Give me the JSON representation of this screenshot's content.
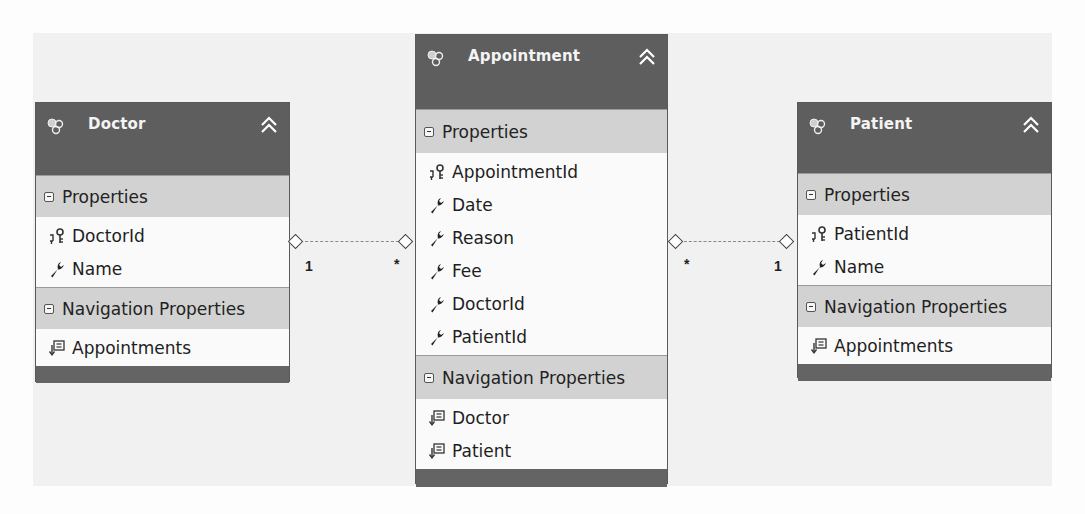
{
  "diagram": {
    "type": "entity-data-model",
    "entities": [
      {
        "name": "Doctor",
        "icon": "entity-icon",
        "collapse_icon": "double-chevron-up-icon",
        "sections": [
          {
            "title": "Properties",
            "items": [
              {
                "label": "DoctorId",
                "icon": "key-icon"
              },
              {
                "label": "Name",
                "icon": "wrench-icon"
              }
            ]
          },
          {
            "title": "Navigation Properties",
            "items": [
              {
                "label": "Appointments",
                "icon": "navigation-property-icon"
              }
            ]
          }
        ]
      },
      {
        "name": "Appointment",
        "icon": "entity-icon",
        "collapse_icon": "double-chevron-up-icon",
        "sections": [
          {
            "title": "Properties",
            "items": [
              {
                "label": "AppointmentId",
                "icon": "key-icon"
              },
              {
                "label": "Date",
                "icon": "wrench-icon"
              },
              {
                "label": "Reason",
                "icon": "wrench-icon"
              },
              {
                "label": "Fee",
                "icon": "wrench-icon"
              },
              {
                "label": "DoctorId",
                "icon": "wrench-icon"
              },
              {
                "label": "PatientId",
                "icon": "wrench-icon"
              }
            ]
          },
          {
            "title": "Navigation Properties",
            "items": [
              {
                "label": "Doctor",
                "icon": "navigation-property-icon"
              },
              {
                "label": "Patient",
                "icon": "navigation-property-icon"
              }
            ]
          }
        ]
      },
      {
        "name": "Patient",
        "icon": "entity-icon",
        "collapse_icon": "double-chevron-up-icon",
        "sections": [
          {
            "title": "Properties",
            "items": [
              {
                "label": "PatientId",
                "icon": "key-icon"
              },
              {
                "label": "Name",
                "icon": "wrench-icon"
              }
            ]
          },
          {
            "title": "Navigation Properties",
            "items": [
              {
                "label": "Appointments",
                "icon": "navigation-property-icon"
              }
            ]
          }
        ]
      }
    ],
    "associations": [
      {
        "from": "Doctor",
        "to": "Appointment",
        "from_multiplicity": "1",
        "to_multiplicity": "*"
      },
      {
        "from": "Appointment",
        "to": "Patient",
        "from_multiplicity": "*",
        "to_multiplicity": "1"
      }
    ]
  },
  "colors": {
    "header": "#5e5e5e",
    "section_header": "#d2d2d2",
    "item_bg": "#fafafa",
    "connector": "#8a8a8a"
  }
}
